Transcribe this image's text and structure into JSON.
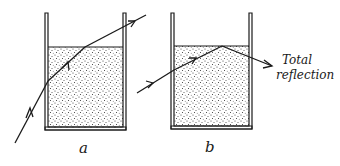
{
  "figure": {
    "panels": [
      {
        "id": "a",
        "label": "a",
        "description": "Ray refracted into liquid and out through the surface"
      },
      {
        "id": "b",
        "label": "b",
        "description": "Ray totally reflected at the liquid surface"
      }
    ],
    "annotation": {
      "line1": "Total",
      "line2": "reflection"
    },
    "colors": {
      "ink": "#1a1a1a",
      "background": "#ffffff",
      "liquid_dots": "#333333"
    }
  }
}
